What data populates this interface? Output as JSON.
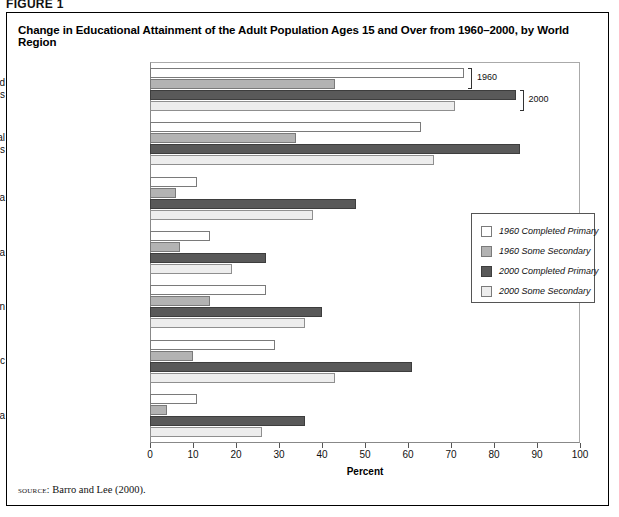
{
  "figure_label": "FIGURE 1",
  "title": "Change in Educational Attainment of the Adult Population Ages 15 and Over from 1960–2000, by World Region",
  "source": {
    "prefix": "source:",
    "text": "Barro and Lee (2000)."
  },
  "annotations": [
    {
      "name": "bracket-1960",
      "label": "1960"
    },
    {
      "name": "bracket-2000",
      "label": "2000"
    }
  ],
  "legend": {
    "position": "right-middle",
    "entries": [
      {
        "label": "1960 Completed Primary",
        "color": "#ffffff"
      },
      {
        "label": "1960 Some Secondary",
        "color": "#b3b3b3"
      },
      {
        "label": "2000 Completed Primary",
        "color": "#595959"
      },
      {
        "label": "2000 Some Secondary",
        "color": "#ededed"
      }
    ]
  },
  "chart_data": {
    "type": "bar",
    "orientation": "horizontal",
    "title": "Change in Educational Attainment of the Adult Population Ages 15 and Over from 1960–2000, by World Region",
    "xlabel": "Percent",
    "ylabel": "",
    "xlim": [
      0,
      100
    ],
    "xticks": [
      0,
      10,
      20,
      30,
      40,
      50,
      60,
      70,
      80,
      90,
      100
    ],
    "grid": false,
    "categories": [
      "Advanced\nCountries",
      "Transitional\nCountries",
      "Middle East- North Africa",
      "Sub-Saharan Africa",
      "Latin America - Caribbean",
      "East Asia - Pacific",
      "South Asia"
    ],
    "series": [
      {
        "name": "1960 Completed Primary",
        "color": "#ffffff",
        "values": [
          73,
          63,
          11,
          14,
          27,
          29,
          11
        ]
      },
      {
        "name": "1960 Some Secondary",
        "color": "#b3b3b3",
        "values": [
          43,
          34,
          6,
          7,
          14,
          10,
          4
        ]
      },
      {
        "name": "2000 Completed Primary",
        "color": "#595959",
        "values": [
          85,
          86,
          48,
          27,
          40,
          61,
          36
        ]
      },
      {
        "name": "2000 Some Secondary",
        "color": "#ededed",
        "values": [
          71,
          66,
          38,
          19,
          36,
          43,
          26
        ]
      }
    ]
  }
}
